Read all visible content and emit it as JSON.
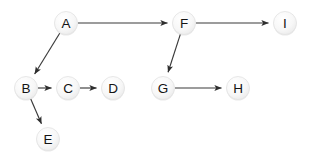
{
  "diagram": {
    "type": "directed-graph",
    "background_color": "#ffffff",
    "node_fill_color": "#f4f4f4",
    "node_stroke_color": "#e2e2e2",
    "edge_color": "#3a3a3a",
    "label_color": "#141414",
    "node_radius": 11.5,
    "nodes": [
      {
        "id": "A",
        "label": "A",
        "cx": 66,
        "cy": 23
      },
      {
        "id": "B",
        "label": "B",
        "cx": 26,
        "cy": 88
      },
      {
        "id": "C",
        "label": "C",
        "cx": 68,
        "cy": 88
      },
      {
        "id": "D",
        "label": "D",
        "cx": 113,
        "cy": 88
      },
      {
        "id": "E",
        "label": "E",
        "cx": 48,
        "cy": 139
      },
      {
        "id": "F",
        "label": "F",
        "cx": 184,
        "cy": 23
      },
      {
        "id": "G",
        "label": "G",
        "cx": 163,
        "cy": 88
      },
      {
        "id": "H",
        "label": "H",
        "cx": 238,
        "cy": 88
      },
      {
        "id": "I",
        "label": "I",
        "cx": 285,
        "cy": 23
      }
    ],
    "edges": [
      {
        "from": "A",
        "to": "F"
      },
      {
        "from": "A",
        "to": "B"
      },
      {
        "from": "B",
        "to": "C"
      },
      {
        "from": "B",
        "to": "E"
      },
      {
        "from": "C",
        "to": "D"
      },
      {
        "from": "F",
        "to": "I"
      },
      {
        "from": "F",
        "to": "G"
      },
      {
        "from": "G",
        "to": "H"
      }
    ]
  }
}
